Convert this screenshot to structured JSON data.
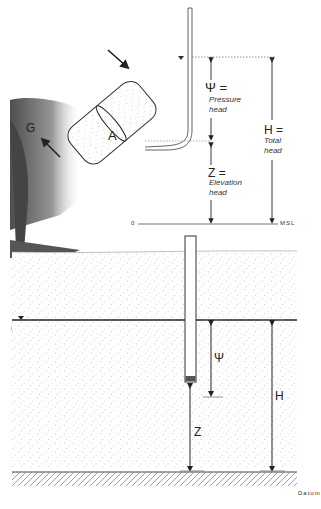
{
  "diagram": {
    "type": "hydraulic head illustration",
    "top_panel": {
      "arrows": {
        "inflow": "inflow-arrow",
        "outflow_label": "G"
      },
      "cross_section_label": "A",
      "pressure_head": {
        "symbol": "Ψ =",
        "line1": "Pressure",
        "line2": "head"
      },
      "elevation_head": {
        "symbol": "Z =",
        "line1": "Elevation",
        "line2": "head"
      },
      "total_head": {
        "symbol": "H =",
        "line1": "Total",
        "line2": "head"
      },
      "reference_left": "0",
      "reference_right": "MSL"
    },
    "bottom_panel": {
      "pressure_label": "Ψ",
      "elevation_label": "Z",
      "total_label": "H",
      "datum_label": "Datum"
    },
    "colors": {
      "line": "#222222",
      "ground": "#f2f2f2",
      "stipple": "#999999",
      "tree": "#555555"
    }
  }
}
